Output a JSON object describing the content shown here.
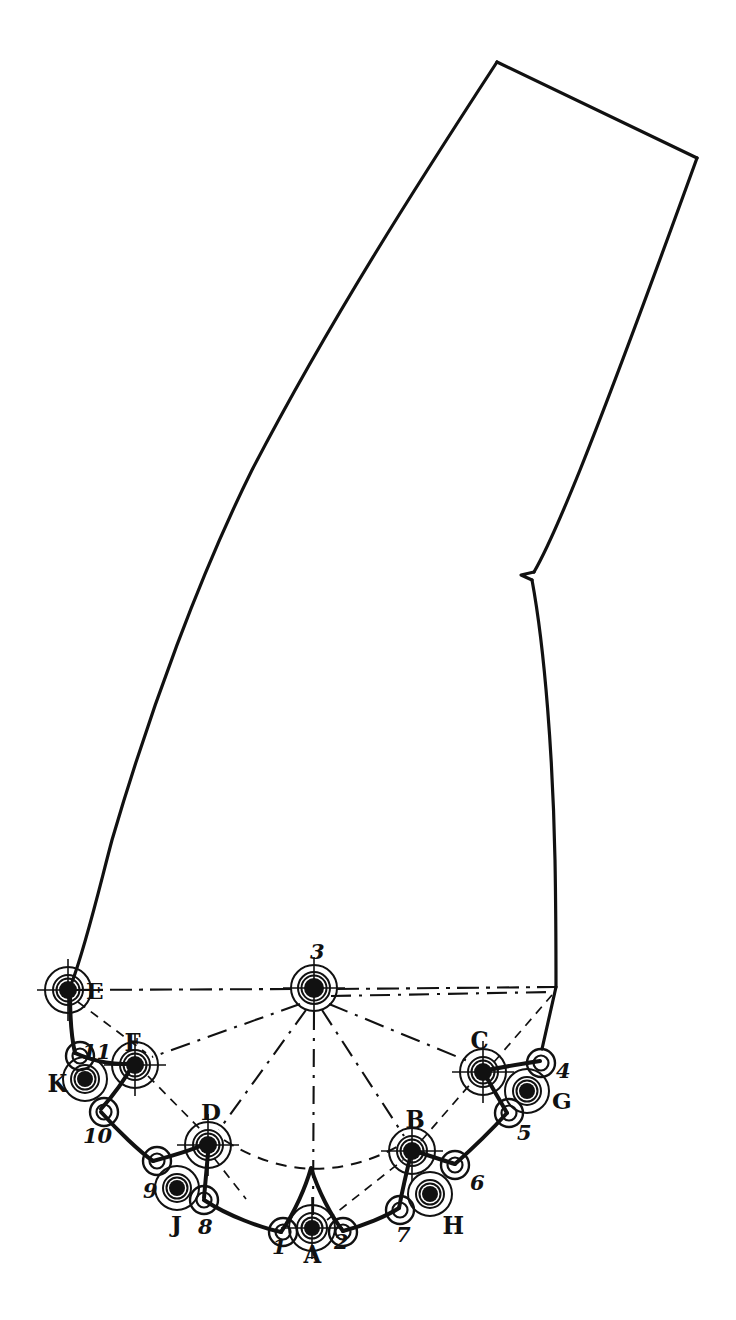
{
  "figure": {
    "kind": "technical-line-drawing",
    "title_text": "",
    "background_color": "#ffffff",
    "ink_color": "#111111",
    "width": 736,
    "height": 1320
  },
  "labels": {
    "letters": [
      {
        "id": "A",
        "text": "A",
        "x": 303,
        "y": 1243,
        "style": "gothic"
      },
      {
        "id": "B",
        "text": "B",
        "x": 405,
        "y": 1108,
        "style": "gothic"
      },
      {
        "id": "C",
        "text": "C",
        "x": 470,
        "y": 1029,
        "style": "gothic"
      },
      {
        "id": "D",
        "text": "D",
        "x": 201,
        "y": 1100,
        "style": "letter"
      },
      {
        "id": "E",
        "text": "E",
        "x": 86,
        "y": 979,
        "style": "letter"
      },
      {
        "id": "F",
        "text": "F",
        "x": 124,
        "y": 1031,
        "style": "gothic"
      },
      {
        "id": "G",
        "text": "G",
        "x": 552,
        "y": 1089,
        "style": "letter"
      },
      {
        "id": "H",
        "text": "H",
        "x": 442,
        "y": 1214,
        "style": "gothic"
      },
      {
        "id": "J",
        "text": "J",
        "x": 171,
        "y": 1212,
        "style": "letter"
      },
      {
        "id": "K",
        "text": "K",
        "x": 47,
        "y": 1072,
        "style": "gothic"
      }
    ],
    "numbers": [
      {
        "id": "1",
        "text": "1",
        "x": 272,
        "y": 1236
      },
      {
        "id": "2",
        "text": "2",
        "x": 334,
        "y": 1231
      },
      {
        "id": "3",
        "text": "3",
        "x": 310,
        "y": 941
      },
      {
        "id": "4",
        "text": "4",
        "x": 556,
        "y": 1060
      },
      {
        "id": "5",
        "text": "5",
        "x": 517,
        "y": 1122
      },
      {
        "id": "6",
        "text": "6",
        "x": 470,
        "y": 1172
      },
      {
        "id": "7",
        "text": "7",
        "x": 396,
        "y": 1224
      },
      {
        "id": "8",
        "text": "8",
        "x": 198,
        "y": 1216
      },
      {
        "id": "9",
        "text": "9",
        "x": 143,
        "y": 1180
      },
      {
        "id": "10",
        "text": "10",
        "x": 83,
        "y": 1125
      },
      {
        "id": "11",
        "text": "11",
        "x": 82,
        "y": 1041
      }
    ]
  },
  "nodes": {
    "letter_pivots": [
      {
        "id": "A",
        "cx": 312,
        "cy": 1228,
        "r_outer": 23,
        "r_mid": 15,
        "r_dot": 8,
        "crosshair": true
      },
      {
        "id": "B",
        "cx": 412,
        "cy": 1151,
        "r_outer": 23,
        "r_mid": 15,
        "r_dot": 9,
        "crosshair": true
      },
      {
        "id": "C",
        "cx": 483,
        "cy": 1072,
        "r_outer": 23,
        "r_mid": 15,
        "r_dot": 9,
        "crosshair": true
      },
      {
        "id": "D",
        "cx": 208,
        "cy": 1145,
        "r_outer": 23,
        "r_mid": 15,
        "r_dot": 9,
        "crosshair": true
      },
      {
        "id": "E",
        "cx": 68,
        "cy": 990,
        "r_outer": 23,
        "r_mid": 15,
        "r_dot": 9,
        "crosshair": true
      },
      {
        "id": "F",
        "cx": 135,
        "cy": 1065,
        "r_outer": 23,
        "r_mid": 15,
        "r_dot": 9,
        "crosshair": true
      },
      {
        "id": "3",
        "cx": 314,
        "cy": 988,
        "r_outer": 23,
        "r_mid": 16,
        "r_dot": 10,
        "crosshair": true
      }
    ],
    "offset_pivots": [
      {
        "id": "G",
        "cx": 527,
        "cy": 1091,
        "r_outer": 22,
        "r_mid": 14,
        "r_dot": 8
      },
      {
        "id": "H",
        "cx": 430,
        "cy": 1194,
        "r_outer": 22,
        "r_mid": 14,
        "r_dot": 8
      },
      {
        "id": "J",
        "cx": 177,
        "cy": 1188,
        "r_outer": 22,
        "r_mid": 14,
        "r_dot": 8
      },
      {
        "id": "K",
        "cx": 85,
        "cy": 1079,
        "r_outer": 22,
        "r_mid": 14,
        "r_dot": 8
      }
    ],
    "hinge_arcs": [
      {
        "id": "1",
        "cx": 283,
        "cy": 1232,
        "r": 14
      },
      {
        "id": "2",
        "cx": 343,
        "cy": 1232,
        "r": 14
      },
      {
        "id": "4",
        "cx": 541,
        "cy": 1063,
        "r": 14
      },
      {
        "id": "5",
        "cx": 509,
        "cy": 1113,
        "r": 14
      },
      {
        "id": "6",
        "cx": 455,
        "cy": 1165,
        "r": 14
      },
      {
        "id": "7",
        "cx": 400,
        "cy": 1210,
        "r": 14
      },
      {
        "id": "8",
        "cx": 204,
        "cy": 1200,
        "r": 14
      },
      {
        "id": "9",
        "cx": 157,
        "cy": 1161,
        "r": 14
      },
      {
        "id": "10",
        "cx": 104,
        "cy": 1112,
        "r": 14
      },
      {
        "id": "11",
        "cx": 80,
        "cy": 1056,
        "r": 14
      }
    ]
  },
  "geometry": {
    "outline_description": "Tall curved blade-like outline (leg/last pattern) narrowing downward to the scalloped hinge chain at the bottom.",
    "baseline_note": "Horizontal dash-dot construction line from E through pivot 3 to the right outline corner.",
    "radial_note": "Dash-dot radial construction lines fan out from pivot 3 to E, F, D, A, B, C and the right corner.",
    "arc_note": "Dashed construction arc from D through the cusp above A to B."
  },
  "colors": {
    "ink": "#111111",
    "paper": "#ffffff"
  }
}
